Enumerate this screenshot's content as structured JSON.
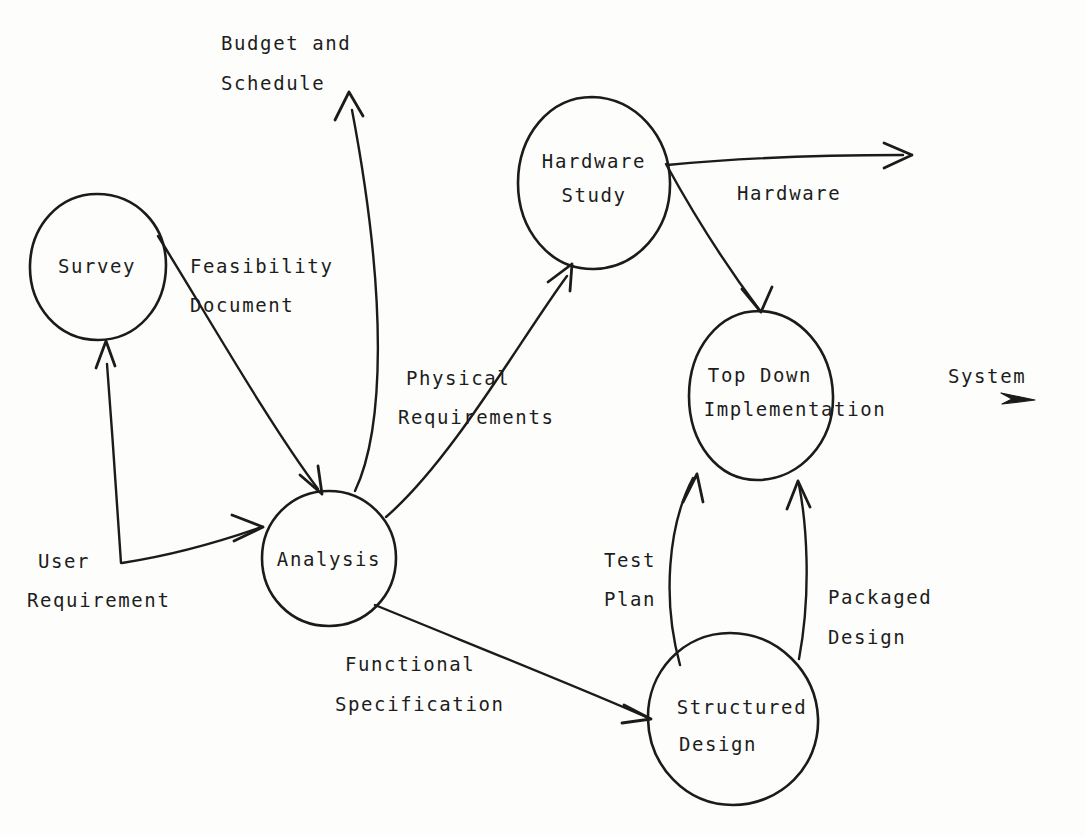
{
  "diagram": {
    "ink_color": "#1b1b1b",
    "background_color": "#fdfdfc",
    "nodes": [
      {
        "id": "survey",
        "label_line1": "Survey",
        "label_line2": "",
        "cx": 97,
        "cy": 267,
        "rx": 68,
        "ry": 73
      },
      {
        "id": "hardware_study",
        "label_line1": "Hardware",
        "label_line2": "Study",
        "cx": 594,
        "cy": 183,
        "rx": 76,
        "ry": 87
      },
      {
        "id": "analysis",
        "label_line1": "Analysis",
        "label_line2": "",
        "cx": 329,
        "cy": 558,
        "rx": 67,
        "ry": 68
      },
      {
        "id": "top_down",
        "label_line1": "Top Down",
        "label_line2": "Implementation",
        "cx": 761,
        "cy": 395,
        "rx": 72,
        "ry": 85
      },
      {
        "id": "structured",
        "label_line1": "Structured",
        "label_line2": "Design",
        "cx": 733,
        "cy": 719,
        "rx": 85,
        "ry": 86
      }
    ],
    "flows": [
      {
        "id": "user_requirement",
        "line1": "User",
        "line2": "Requirement",
        "x": 38,
        "y": 560
      },
      {
        "id": "feasibility",
        "line1": "Feasibility",
        "line2": "Document",
        "x": 224,
        "y": 267
      },
      {
        "id": "budget_schedule",
        "line1": "Budget and",
        "line2": "Schedule",
        "x": 221,
        "y": 44
      },
      {
        "id": "physical_req",
        "line1": "Physical",
        "line2": "Requirements",
        "x": 406,
        "y": 379
      },
      {
        "id": "hardware",
        "line1": "Hardware",
        "line2": "",
        "x": 737,
        "y": 193
      },
      {
        "id": "functional_spec",
        "line1": "Functional",
        "line2": "Specification",
        "x": 345,
        "y": 664
      },
      {
        "id": "test_plan",
        "line1": "Test",
        "line2": "Plan",
        "x": 604,
        "y": 559
      },
      {
        "id": "packaged_design",
        "line1": "Packaged",
        "line2": "Design",
        "x": 828,
        "y": 597
      },
      {
        "id": "system",
        "line1": "System",
        "line2": "",
        "x": 948,
        "y": 377
      }
    ],
    "edges": [
      {
        "id": "user-req-to-survey",
        "from": "User Requirement",
        "to": "Survey"
      },
      {
        "id": "user-req-to-analysis",
        "from": "User Requirement",
        "to": "Analysis"
      },
      {
        "id": "survey-to-analysis",
        "from": "Survey",
        "to": "Analysis",
        "label": "Feasibility Document"
      },
      {
        "id": "analysis-to-budget",
        "from": "Analysis",
        "to": "Budget and Schedule"
      },
      {
        "id": "analysis-to-hardware-study",
        "from": "Analysis",
        "to": "Hardware Study",
        "label": "Physical Requirements"
      },
      {
        "id": "hardware-study-to-hardware",
        "from": "Hardware Study",
        "to": "Hardware"
      },
      {
        "id": "hardware-study-to-top-down",
        "from": "Hardware Study",
        "to": "Top Down Implementation"
      },
      {
        "id": "analysis-to-structured",
        "from": "Analysis",
        "to": "Structured Design",
        "label": "Functional Specification"
      },
      {
        "id": "structured-to-top-down-test",
        "from": "Structured Design",
        "to": "Top Down Implementation",
        "label": "Test Plan"
      },
      {
        "id": "structured-to-top-down-pkg",
        "from": "Structured Design",
        "to": "Top Down Implementation",
        "label": "Packaged Design"
      },
      {
        "id": "top-down-to-system",
        "from": "Top Down Implementation",
        "to": "System"
      }
    ]
  }
}
